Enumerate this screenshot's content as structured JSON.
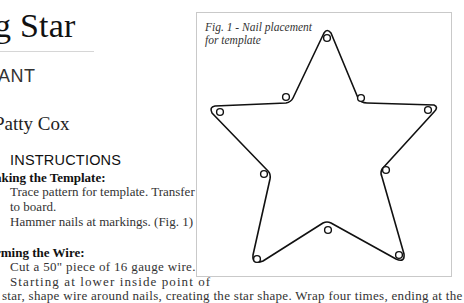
{
  "page": {
    "title": "g Star",
    "category": "ANT",
    "author": "Patty Cox",
    "instructions_heading": "INSTRUCTIONS"
  },
  "sections": [
    {
      "heading": "aking the Template:",
      "steps": [
        "Trace pattern for template. Transfer",
        "to board.",
        "Hammer nails at markings. (Fig. 1)"
      ]
    },
    {
      "heading": "rming the Wire:",
      "steps": [
        "Cut a 50\" piece of 16 gauge wire.",
        "Starting at lower inside point of",
        "star, shape wire around nails, creating the star shape. Wrap four times, ending at the"
      ]
    }
  ],
  "figure": {
    "caption_line1": "Fig. 1 - Nail placement",
    "caption_line2": "for template",
    "nails": [
      {
        "name": "top-point",
        "x": 326,
        "y": 37
      },
      {
        "name": "upper-inner-right",
        "x": 360,
        "y": 97
      },
      {
        "name": "right-point",
        "x": 427,
        "y": 109
      },
      {
        "name": "lower-inner-right",
        "x": 385,
        "y": 169
      },
      {
        "name": "bottom-right-point",
        "x": 398,
        "y": 254
      },
      {
        "name": "bottom-inner",
        "x": 327,
        "y": 229
      },
      {
        "name": "bottom-left-point",
        "x": 256,
        "y": 258
      },
      {
        "name": "lower-inner-left",
        "x": 263,
        "y": 173
      },
      {
        "name": "left-point",
        "x": 219,
        "y": 111
      },
      {
        "name": "upper-inner-left",
        "x": 285,
        "y": 96
      }
    ]
  }
}
